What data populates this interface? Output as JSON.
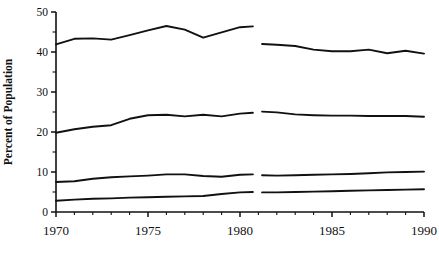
{
  "chart_data": {
    "type": "line",
    "title": "",
    "subtitle": "",
    "xlabel": "",
    "ylabel": "Percent of Population",
    "xlim": [
      1970,
      1990
    ],
    "ylim": [
      0,
      50
    ],
    "grid": false,
    "legend": false,
    "legend_position": "none",
    "x_tick_labels": [
      "1970",
      "1975",
      "1980",
      "1985",
      "1990"
    ],
    "x_ticks": [
      1970,
      1975,
      1980,
      1985,
      1990
    ],
    "x_minor_ticks": [
      1971,
      1972,
      1973,
      1974,
      1976,
      1977,
      1978,
      1979,
      1981,
      1982,
      1983,
      1984,
      1986,
      1987,
      1988,
      1989
    ],
    "y_tick_labels": [
      "0",
      "10",
      "20",
      "30",
      "40",
      "50"
    ],
    "y_ticks": [
      0,
      10,
      20,
      30,
      40,
      50
    ],
    "y_minor_ticks": [
      5,
      15,
      25,
      35,
      45
    ],
    "note": "Each series is drawn as two disjoint segments with a break between 1980 and 1981.",
    "series": [
      {
        "name": "series-1",
        "segments": [
          {
            "x": [
              1970,
              1971,
              1972,
              1973,
              1974,
              1975,
              1976,
              1977,
              1978,
              1979,
              1980,
              1980.7
            ],
            "y": [
              41.9,
              43.3,
              43.4,
              43.1,
              44.2,
              45.4,
              46.5,
              45.6,
              43.6,
              44.9,
              46.2,
              46.4
            ]
          },
          {
            "x": [
              1981.2,
              1982,
              1983,
              1984,
              1985,
              1986,
              1987,
              1988,
              1989,
              1990
            ],
            "y": [
              42.0,
              41.8,
              41.5,
              40.6,
              40.2,
              40.2,
              40.6,
              39.7,
              40.3,
              39.6
            ]
          }
        ]
      },
      {
        "name": "series-2",
        "segments": [
          {
            "x": [
              1970,
              1971,
              1972,
              1973,
              1974,
              1975,
              1976,
              1977,
              1978,
              1979,
              1980,
              1980.7
            ],
            "y": [
              19.8,
              20.7,
              21.3,
              21.7,
              23.3,
              24.2,
              24.3,
              23.9,
              24.3,
              23.9,
              24.6,
              24.8
            ]
          },
          {
            "x": [
              1981.2,
              1982,
              1983,
              1984,
              1985,
              1986,
              1987,
              1988,
              1989,
              1990
            ],
            "y": [
              25.1,
              24.9,
              24.4,
              24.2,
              24.1,
              24.1,
              24.0,
              24.0,
              24.0,
              23.8
            ]
          }
        ]
      },
      {
        "name": "series-3",
        "segments": [
          {
            "x": [
              1970,
              1971,
              1972,
              1973,
              1974,
              1975,
              1976,
              1977,
              1978,
              1979,
              1980,
              1980.7
            ],
            "y": [
              7.5,
              7.7,
              8.3,
              8.7,
              8.9,
              9.1,
              9.4,
              9.4,
              9.0,
              8.8,
              9.3,
              9.4
            ]
          },
          {
            "x": [
              1981.2,
              1982,
              1983,
              1984,
              1985,
              1986,
              1987,
              1988,
              1989,
              1990
            ],
            "y": [
              9.2,
              9.1,
              9.2,
              9.3,
              9.4,
              9.5,
              9.7,
              9.9,
              10.0,
              10.1
            ]
          }
        ]
      },
      {
        "name": "series-4",
        "segments": [
          {
            "x": [
              1970,
              1971,
              1972,
              1973,
              1974,
              1975,
              1976,
              1977,
              1978,
              1979,
              1980,
              1980.7
            ],
            "y": [
              2.8,
              3.1,
              3.3,
              3.4,
              3.6,
              3.7,
              3.8,
              3.9,
              4.0,
              4.5,
              4.9,
              5.0
            ]
          },
          {
            "x": [
              1981.2,
              1982,
              1983,
              1984,
              1985,
              1986,
              1987,
              1988,
              1989,
              1990
            ],
            "y": [
              4.9,
              4.9,
              5.0,
              5.1,
              5.2,
              5.3,
              5.4,
              5.5,
              5.6,
              5.7
            ]
          }
        ]
      }
    ]
  },
  "axes": {
    "y_title": "Percent of Population"
  }
}
